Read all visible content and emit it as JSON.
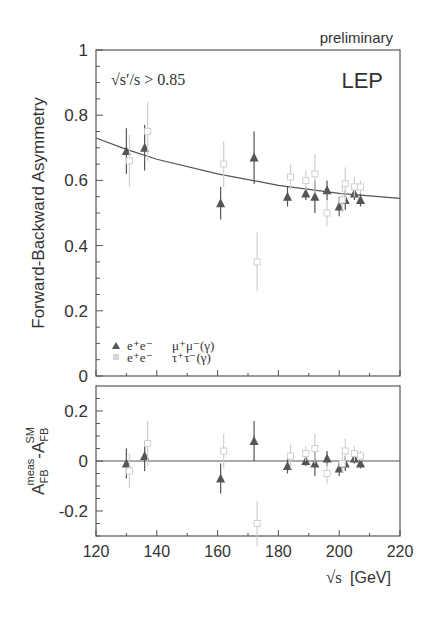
{
  "header": {
    "preliminary_label": "preliminary",
    "cut_label": "√s′/s > 0.85",
    "experiment_label": "LEP"
  },
  "legend": [
    {
      "marker": "triangle",
      "label_left": "e⁺e⁻",
      "label_right": "μ⁺μ⁻(γ)",
      "color": "#555555"
    },
    {
      "marker": "square",
      "label_left": "e⁺e⁻",
      "label_right": "τ⁺τ⁻(γ)",
      "color": "#cfcfcf"
    }
  ],
  "chart_data": [
    {
      "type": "scatter",
      "title": "",
      "annotations": [
        "preliminary",
        "√s′/s > 0.85",
        "LEP"
      ],
      "xlabel": "√s [GeV]",
      "ylabel": "Forward-Backward Asymmetry",
      "xlim": [
        120,
        220
      ],
      "ylim": [
        0,
        1
      ],
      "xticks": [
        120,
        140,
        160,
        180,
        200,
        220
      ],
      "yticks": [
        0,
        0.2,
        0.4,
        0.6,
        0.8,
        1
      ],
      "ytick_labels": [
        "0",
        "0.2",
        "0.4",
        "0.6",
        "0.8",
        "1"
      ],
      "grid": false,
      "legend_position": "lower-left",
      "series": [
        {
          "name": "e+e- → μ+μ-(γ)",
          "marker": "triangle",
          "x": [
            130,
            136,
            161,
            172,
            183,
            189,
            192,
            196,
            200,
            202,
            205,
            207
          ],
          "y": [
            0.69,
            0.7,
            0.53,
            0.67,
            0.55,
            0.56,
            0.55,
            0.57,
            0.52,
            0.54,
            0.56,
            0.54
          ],
          "yerr": [
            0.07,
            0.07,
            0.05,
            0.08,
            0.03,
            0.02,
            0.05,
            0.03,
            0.03,
            0.03,
            0.02,
            0.02
          ]
        },
        {
          "name": "e+e- → τ+τ-(γ)",
          "marker": "square",
          "x": [
            131,
            137,
            162,
            173,
            184,
            189,
            192,
            196,
            201,
            202,
            205,
            207
          ],
          "y": [
            0.66,
            0.75,
            0.65,
            0.35,
            0.61,
            0.6,
            0.62,
            0.5,
            0.54,
            0.59,
            0.58,
            0.58
          ],
          "yerr": [
            0.08,
            0.09,
            0.07,
            0.09,
            0.04,
            0.03,
            0.06,
            0.04,
            0.04,
            0.05,
            0.03,
            0.02
          ]
        },
        {
          "name": "SM prediction",
          "type": "line",
          "x": [
            120,
            130,
            140,
            160,
            180,
            200,
            220
          ],
          "y": [
            0.73,
            0.695,
            0.665,
            0.62,
            0.585,
            0.56,
            0.545
          ]
        }
      ]
    },
    {
      "type": "scatter",
      "title": "",
      "xlabel": "√s [GeV]",
      "ylabel": "A_FB^meas - A_FB^SM",
      "xlim": [
        120,
        220
      ],
      "ylim": [
        -0.3,
        0.3
      ],
      "xticks": [
        120,
        140,
        160,
        180,
        200,
        220
      ],
      "xtick_labels": [
        "120",
        "140",
        "160",
        "180",
        "200",
        "220"
      ],
      "yticks": [
        -0.2,
        0,
        0.2
      ],
      "ytick_labels": [
        "-0.2",
        "0",
        "0.2"
      ],
      "grid": false,
      "series": [
        {
          "name": "e+e- → μ+μ-(γ)",
          "marker": "triangle",
          "x": [
            130,
            136,
            161,
            172,
            183,
            189,
            192,
            196,
            200,
            202,
            205,
            207
          ],
          "y": [
            -0.01,
            0.02,
            -0.07,
            0.08,
            -0.02,
            0.0,
            -0.01,
            0.01,
            -0.03,
            -0.01,
            0.01,
            -0.01
          ],
          "yerr": [
            0.06,
            0.06,
            0.06,
            0.08,
            0.03,
            0.02,
            0.05,
            0.03,
            0.03,
            0.03,
            0.02,
            0.02
          ]
        },
        {
          "name": "e+e- → τ+τ-(γ)",
          "marker": "square",
          "x": [
            131,
            137,
            162,
            173,
            184,
            189,
            192,
            196,
            201,
            202,
            205,
            207
          ],
          "y": [
            -0.04,
            0.07,
            0.04,
            -0.25,
            0.02,
            0.03,
            0.05,
            -0.05,
            -0.01,
            0.04,
            0.03,
            0.02
          ],
          "yerr": [
            0.07,
            0.09,
            0.07,
            0.09,
            0.05,
            0.03,
            0.06,
            0.04,
            0.04,
            0.05,
            0.03,
            0.02
          ]
        }
      ]
    }
  ],
  "axes": {
    "upper_ylabel": "Forward-Backward Asymmetry",
    "lower_ylabel_main": "A",
    "lower_ylabel_sub1": "FB",
    "lower_ylabel_sup1": "meas",
    "lower_ylabel_minus": "-A",
    "lower_ylabel_sub2": "FB",
    "lower_ylabel_sup2": "SM",
    "xlabel_root": "√s",
    "xlabel_unit": "[GeV]",
    "upper_yticks": [
      "0",
      "0.2",
      "0.4",
      "0.6",
      "0.8",
      "1"
    ],
    "lower_yticks": [
      "-0.2",
      "0",
      "0.2"
    ],
    "xticks": [
      "120",
      "140",
      "160",
      "180",
      "200",
      "220"
    ]
  }
}
